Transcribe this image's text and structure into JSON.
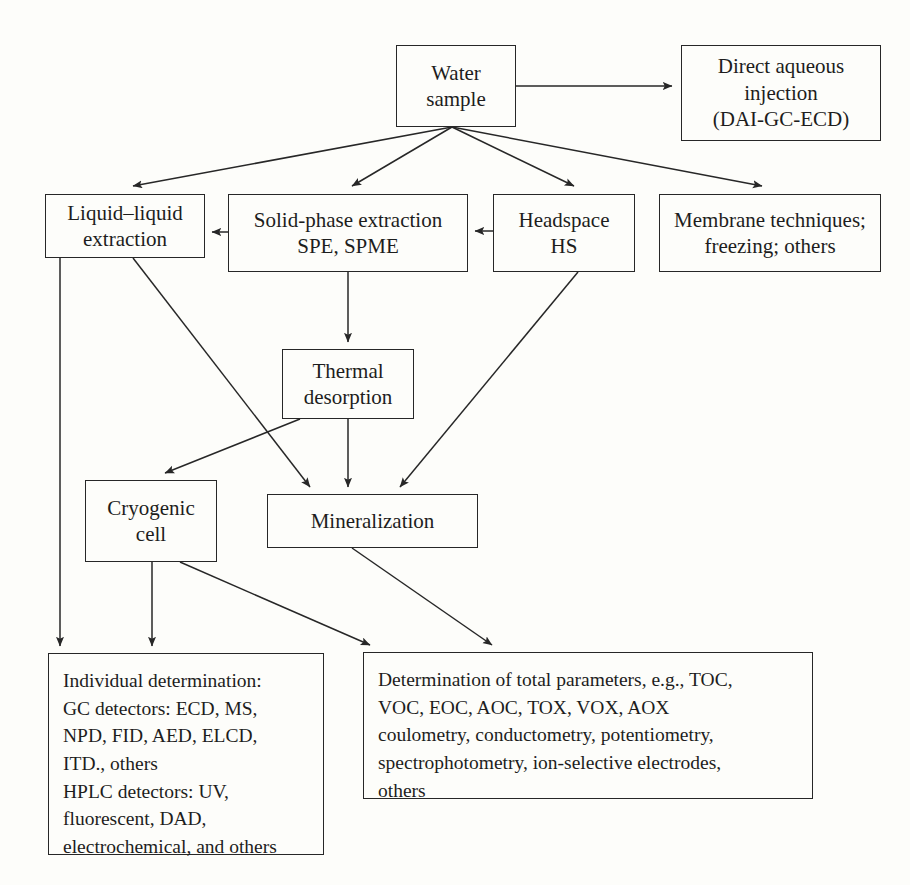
{
  "figure": {
    "kind": "flowchart",
    "palette": {
      "background": "#fdfdfa",
      "stroke": "#272727",
      "text": "#1d1d1d"
    }
  },
  "nodes": [
    {
      "id": "water-sample",
      "label": "Water\nsample",
      "x": 396,
      "y": 45,
      "w": 120,
      "h": 82,
      "font": 21
    },
    {
      "id": "direct-aqueous-injection",
      "label": "Direct aqueous\ninjection\n(DAI-GC-ECD)",
      "x": 681,
      "y": 45,
      "w": 200,
      "h": 96,
      "font": 21
    },
    {
      "id": "liquid-liquid-extraction",
      "label": "Liquid–liquid\nextraction",
      "x": 45,
      "y": 194,
      "w": 160,
      "h": 64,
      "font": 21
    },
    {
      "id": "solid-phase-extraction",
      "label": "Solid-phase extraction\nSPE, SPME",
      "x": 228,
      "y": 194,
      "w": 240,
      "h": 78,
      "font": 21
    },
    {
      "id": "headspace",
      "label": "Headspace\nHS",
      "x": 493,
      "y": 194,
      "w": 142,
      "h": 78,
      "font": 21
    },
    {
      "id": "membrane-techniques",
      "label": "Membrane techniques;\nfreezing; others",
      "x": 659,
      "y": 194,
      "w": 222,
      "h": 78,
      "font": 21
    },
    {
      "id": "thermal-desorption",
      "label": "Thermal\ndesorption",
      "x": 282,
      "y": 349,
      "w": 132,
      "h": 70,
      "font": 21
    },
    {
      "id": "cryogenic-cell",
      "label": "Cryogenic\ncell",
      "x": 85,
      "y": 480,
      "w": 132,
      "h": 82,
      "font": 21
    },
    {
      "id": "mineralization",
      "label": "Mineralization",
      "x": 267,
      "y": 494,
      "w": 211,
      "h": 54,
      "font": 21
    },
    {
      "id": "individual-determination",
      "label": "Individual determination:\nGC detectors: ECD, MS,\nNPD, FID, AED, ELCD,\nITD., others\nHPLC detectors: UV,\nfluorescent, DAD,\nelectrochemical, and others",
      "x": 48,
      "y": 653,
      "w": 276,
      "h": 202,
      "font": 19.5,
      "block": true
    },
    {
      "id": "total-parameters",
      "label": "Determination of total parameters, e.g., TOC,\nVOC, EOC, AOC, TOX, VOX, AOX\ncoulometry, conductometry, potentiometry,\nspectrophotometry, ion-selective electrodes,\nothers",
      "x": 363,
      "y": 652,
      "w": 450,
      "h": 147,
      "font": 19.5,
      "block": true
    }
  ],
  "edges": [
    {
      "id": "water-to-dai",
      "from": "water-sample",
      "to": "direct-aqueous-injection",
      "points": "516,86 672,86"
    },
    {
      "id": "water-to-liquid-liquid",
      "from": "water-sample",
      "to": "liquid-liquid-extraction",
      "points": "452,127 133,186"
    },
    {
      "id": "water-to-spe",
      "from": "water-sample",
      "to": "solid-phase-extraction",
      "points": "452,127 352,186"
    },
    {
      "id": "water-to-headspace",
      "from": "water-sample",
      "to": "headspace",
      "points": "452,127 574,186"
    },
    {
      "id": "water-to-membrane",
      "from": "water-sample",
      "to": "membrane-techniques",
      "points": "452,127 762,186"
    },
    {
      "id": "spe-to-liquid-liquid",
      "from": "solid-phase-extraction",
      "to": "liquid-liquid-extraction",
      "points": "228,232 212,232"
    },
    {
      "id": "headspace-to-spe",
      "from": "headspace",
      "to": "solid-phase-extraction",
      "points": "493,231 475,231"
    },
    {
      "id": "spe-to-thermal",
      "from": "solid-phase-extraction",
      "to": "thermal-desorption",
      "points": "348,272 348,342"
    },
    {
      "id": "thermal-to-cryogenic",
      "from": "thermal-desorption",
      "to": "cryogenic-cell",
      "points": "300,419 165,473"
    },
    {
      "id": "thermal-to-mineralization",
      "from": "thermal-desorption",
      "to": "mineralization",
      "points": "348,419 348,487"
    },
    {
      "id": "liquid-to-mineralization",
      "from": "liquid-liquid-extraction",
      "to": "mineralization",
      "points": "133,258 310,487"
    },
    {
      "id": "headspace-to-mineralization",
      "from": "headspace",
      "to": "mineralization",
      "points": "578,272 400,487"
    },
    {
      "id": "liquid-to-individual",
      "from": "liquid-liquid-extraction",
      "to": "individual-determination",
      "points": "60,258 60,646"
    },
    {
      "id": "cryogenic-to-individual",
      "from": "cryogenic-cell",
      "to": "individual-determination",
      "points": "152,562 152,646"
    },
    {
      "id": "cryogenic-to-total",
      "from": "cryogenic-cell",
      "to": "total-parameters",
      "points": "180,562 370,645"
    },
    {
      "id": "mineralization-to-total",
      "from": "mineralization",
      "to": "total-parameters",
      "points": "352,548 492,645"
    }
  ]
}
